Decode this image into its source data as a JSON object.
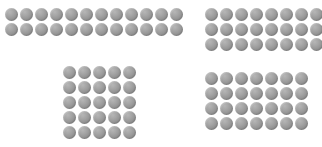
{
  "canvas": {
    "width": 322,
    "height": 147,
    "background_color": "#ffffff",
    "description": "Four rectangular clusters of identical gray circular dots arranged on a plain white field"
  },
  "dot_style": {
    "shape": "circle",
    "diameter_px": 13,
    "pitch_px": 15,
    "fill_color": "#9a9a9a",
    "highlight_color": "#b6b6b6",
    "shadow_color": "#7e7e7e"
  },
  "chart_data": {
    "type": "scatter",
    "title": "",
    "subtitle": "",
    "xlabel": "",
    "ylabel": "",
    "grid": false,
    "legend": "none",
    "groups": [
      {
        "name": "top-left",
        "label": "Top-left cluster",
        "columns": 12,
        "rows": 2,
        "count": 24,
        "origin_x": 5,
        "origin_y": 8
      },
      {
        "name": "top-right",
        "label": "Top-right cluster",
        "columns": 8,
        "rows": 3,
        "count": 24,
        "origin_x": 205,
        "origin_y": 8
      },
      {
        "name": "bottom-left",
        "label": "Bottom-left cluster",
        "columns": 5,
        "rows": 5,
        "count": 25,
        "origin_x": 63,
        "origin_y": 66
      },
      {
        "name": "bottom-right",
        "label": "Bottom-right cluster",
        "columns": 7,
        "rows": 4,
        "count": 28,
        "origin_x": 205,
        "origin_y": 72
      }
    ],
    "total_dots": 101
  }
}
